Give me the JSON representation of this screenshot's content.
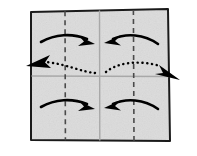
{
  "figure": {
    "title": "Origami paper fold step diagram",
    "description": "A square sheet of paper with vertical quarter fold lines and center creases, four curved arrows folding the left and right edges inward, and two dotted arrows indicating outward motion.",
    "canvas": {
      "width": 197,
      "height": 156
    }
  },
  "colors": {
    "paper_fill": "#dcdcdc",
    "paper_edge": "#1a1a1a",
    "dashed_fold": "#4a4a4a",
    "solid_crease": "#a8a8a8",
    "arrow": "#000000",
    "background": "#ffffff"
  },
  "paper": {
    "name": "square-sheet",
    "corners": {
      "top_left": {
        "x": 31,
        "y": 12
      },
      "top_right": {
        "x": 168,
        "y": 9
      },
      "bottom_right": {
        "x": 170,
        "y": 141
      },
      "bottom_left": {
        "x": 31,
        "y": 140
      }
    }
  },
  "fold_lines": [
    {
      "name": "quarter-fold-left",
      "type": "dashed",
      "orientation": "vertical",
      "x": 65
    },
    {
      "name": "quarter-fold-right",
      "type": "dashed",
      "orientation": "vertical",
      "x": 133
    },
    {
      "name": "center-crease-vertical",
      "type": "solid",
      "orientation": "vertical",
      "x": 99
    },
    {
      "name": "center-crease-horizontal",
      "type": "solid",
      "orientation": "horizontal",
      "y": 76
    }
  ],
  "arrows": [
    {
      "name": "fold-arrow-top-left",
      "style": "solid",
      "direction": "right",
      "region": "top-left",
      "meaning": "fold left edge inward toward center"
    },
    {
      "name": "fold-arrow-top-right",
      "style": "solid",
      "direction": "left",
      "region": "top-right",
      "meaning": "fold right edge inward toward center"
    },
    {
      "name": "fold-arrow-bottom-left",
      "style": "solid",
      "direction": "right",
      "region": "bottom-left",
      "meaning": "fold left edge inward toward center"
    },
    {
      "name": "fold-arrow-bottom-right",
      "style": "solid",
      "direction": "left",
      "region": "bottom-right",
      "meaning": "fold right edge inward toward center"
    },
    {
      "name": "pull-arrow-left",
      "style": "dotted",
      "direction": "outward-left",
      "region": "middle-left",
      "meaning": "hidden layer pulled out to the left"
    },
    {
      "name": "pull-arrow-right",
      "style": "dotted",
      "direction": "outward-right",
      "region": "middle-right",
      "meaning": "hidden layer pulled out to the right"
    }
  ]
}
